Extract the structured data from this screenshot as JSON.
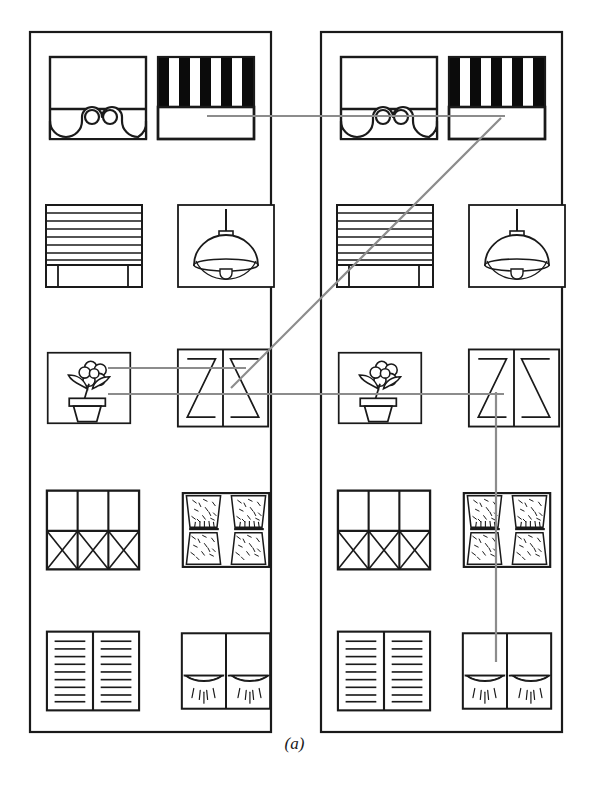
{
  "figure": {
    "caption": "(a)",
    "stroke_color": "#1a1a1a",
    "link_color": "#8c8c8c",
    "background": "#ffffff",
    "width": 589,
    "height": 786
  },
  "panels": [
    {
      "id": "left-panel",
      "name": "left-catalogue-panel",
      "x": 30,
      "y": 32,
      "width": 241,
      "height": 700,
      "rows": [
        {
          "left_icon": "window-with-valance-icon",
          "right_icon": "striped-awning-icon"
        },
        {
          "left_icon": "venetian-blind-icon",
          "right_icon": "pendant-lamp-icon"
        },
        {
          "left_icon": "potted-plant-icon",
          "right_icon": "double-shutter-icon"
        },
        {
          "left_icon": "lattice-window-icon",
          "right_icon": "patterned-curtain-icon"
        },
        {
          "left_icon": "louvered-shutter-icon",
          "right_icon": "swag-curtain-icon"
        }
      ]
    },
    {
      "id": "right-panel",
      "name": "right-catalogue-panel",
      "x": 321,
      "y": 32,
      "width": 241,
      "height": 700,
      "rows": [
        {
          "left_icon": "window-with-valance-icon",
          "right_icon": "striped-awning-icon"
        },
        {
          "left_icon": "venetian-blind-icon",
          "right_icon": "pendant-lamp-icon"
        },
        {
          "left_icon": "potted-plant-icon",
          "right_icon": "double-shutter-icon"
        },
        {
          "left_icon": "lattice-window-icon",
          "right_icon": "patterned-curtain-icon"
        },
        {
          "left_icon": "louvered-shutter-icon",
          "right_icon": "swag-curtain-icon"
        }
      ]
    }
  ],
  "icon_labels": {
    "window-with-valance-icon": "window with valance",
    "striped-awning-icon": "striped awning blind",
    "venetian-blind-icon": "venetian blind",
    "pendant-lamp-icon": "pendant lamp",
    "potted-plant-icon": "potted flowering plant",
    "double-shutter-icon": "double opening shutter",
    "lattice-window-icon": "lattice window",
    "patterned-curtain-icon": "patterned curtain pair",
    "louvered-shutter-icon": "louvered shutter pair",
    "swag-curtain-icon": "swag curtain pair"
  },
  "connections": [
    {
      "name": "link-awning-left-to-awning-right",
      "kind": "horizontal",
      "from": "left-panel.row1.striped-awning-icon",
      "to": "right-panel.row1.striped-awning-icon",
      "x1": 207,
      "y1": 116,
      "x2": 505,
      "y2": 116
    },
    {
      "name": "link-shutter-left-to-awning-right",
      "kind": "diagonal",
      "from": "left-panel.row3.double-shutter-icon",
      "to": "right-panel.row1.striped-awning-icon",
      "x1": 231,
      "y1": 388,
      "x2": 501,
      "y2": 118
    },
    {
      "name": "link-plant-left-upper-to-shutter-right",
      "kind": "horizontal",
      "from": "left-panel.row3.potted-plant-icon",
      "to": "left-panel.row3.double-shutter-icon",
      "x1": 108,
      "y1": 368,
      "x2": 246,
      "y2": 368
    },
    {
      "name": "link-plant-left-lower-to-shutter-right",
      "kind": "horizontal",
      "from": "left-panel.row3.potted-plant-icon",
      "to": "right-panel.row3.double-shutter-icon",
      "x1": 108,
      "y1": 394,
      "x2": 504,
      "y2": 394
    },
    {
      "name": "link-shutter-right-to-swag-curtain-right",
      "kind": "vertical",
      "from": "right-panel.row3.double-shutter-icon",
      "to": "right-panel.row5.swag-curtain-icon",
      "x1": 496,
      "y1": 392,
      "x2": 496,
      "y2": 662
    }
  ]
}
